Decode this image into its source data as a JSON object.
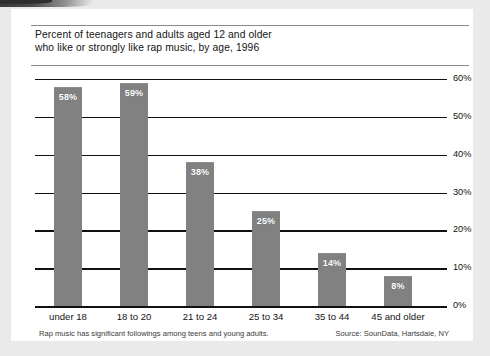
{
  "card": {
    "title_line1": "Percent of teenagers and adults aged 12 and older",
    "title_line2": "who like or strongly like rap music, by age, 1996",
    "footer_note": "Rap music has significant followings among teens and young adults.",
    "footer_source": "Source: SounData, Hartsdale, NY"
  },
  "colors": {
    "bar": "#818181",
    "axis": "#111111",
    "page_background": "#eaeaea",
    "card_background": "#ffffff",
    "value_label": "#ffffff"
  },
  "chart_data": {
    "type": "bar",
    "title": "Percent of teenagers and adults aged 12 and older who like or strongly like rap music, by age, 1996",
    "xlabel": "",
    "ylabel": "",
    "categories": [
      "under 18",
      "18 to 20",
      "21 to 24",
      "25 to 34",
      "35 to 44",
      "45 and older"
    ],
    "values": [
      58,
      59,
      38,
      25,
      14,
      8
    ],
    "value_labels": [
      "58%",
      "59%",
      "38%",
      "25%",
      "14%",
      "8%"
    ],
    "ylim": [
      0,
      60
    ],
    "yticks": [
      0,
      10,
      20,
      30,
      40,
      50,
      60
    ],
    "ytick_labels": [
      "0%",
      "10%",
      "20%",
      "30%",
      "40%",
      "50%",
      "60%"
    ],
    "grid": true,
    "legend": false,
    "units": "percent"
  }
}
